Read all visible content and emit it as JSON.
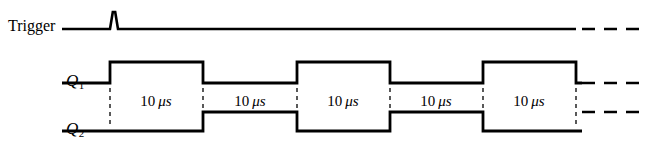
{
  "figure": {
    "type": "timing-diagram",
    "width": 647,
    "height": 166,
    "background_color": "#ffffff",
    "line_color": "#000000"
  },
  "signals": [
    {
      "name": "trigger",
      "label": "Trigger",
      "label_x": 8,
      "label_y": 29,
      "baseline_y": 29,
      "pulse": {
        "x": 114,
        "peak_y": 12,
        "half_width": 4
      },
      "line_start_x": 62,
      "line_end_x": 576,
      "dashed_tail": {
        "start_x": 582,
        "end_x": 640
      }
    },
    {
      "name": "q1",
      "label": "Q",
      "subscript": "1",
      "label_x": 66,
      "label_y": 83,
      "baseline_y": 83,
      "high_y": 62,
      "line_start_x": 62,
      "initial_state": "low",
      "dashed_tail": {
        "start_x": 582,
        "end_x": 640,
        "y": 83
      }
    },
    {
      "name": "q2",
      "label": "Q",
      "subscript": "2",
      "label_x": 66,
      "label_y": 131,
      "baseline_y": 131,
      "high_y": 112,
      "line_start_x": 62,
      "initial_state": "low",
      "dashed_tail": {
        "start_x": 582,
        "end_x": 640,
        "y": 112
      }
    }
  ],
  "timing": {
    "edges_x": [
      110,
      203,
      297,
      390,
      483,
      576
    ],
    "q1_states": [
      "high",
      "low",
      "high",
      "low",
      "high"
    ],
    "q2_states": [
      "low",
      "high",
      "low",
      "high",
      "low"
    ],
    "guide_line_top_y": 88,
    "guide_line_bottom_y": 126
  },
  "intervals": [
    {
      "index": 0,
      "value": "10",
      "unit": "μs",
      "center_x": 156,
      "center_y": 101
    },
    {
      "index": 1,
      "value": "10",
      "unit": "μs",
      "center_x": 250,
      "center_y": 101
    },
    {
      "index": 2,
      "value": "10",
      "unit": "μs",
      "center_x": 343,
      "center_y": 101
    },
    {
      "index": 3,
      "value": "10",
      "unit": "μs",
      "center_x": 436,
      "center_y": 101
    },
    {
      "index": 4,
      "value": "10",
      "unit": "μs",
      "center_x": 529,
      "center_y": 101
    }
  ],
  "chart_data": {
    "type": "line",
    "title": "",
    "xlabel": "",
    "ylabel": "",
    "series": [
      {
        "name": "Trigger",
        "values": [
          0,
          1,
          0,
          0,
          0,
          0,
          0
        ]
      },
      {
        "name": "Q1",
        "values": [
          0,
          1,
          0,
          1,
          0,
          1
        ]
      },
      {
        "name": "Q2",
        "values": [
          0,
          0,
          1,
          0,
          1,
          0
        ]
      }
    ],
    "interval_labels": [
      "10 μs",
      "10 μs",
      "10 μs",
      "10 μs",
      "10 μs"
    ]
  }
}
